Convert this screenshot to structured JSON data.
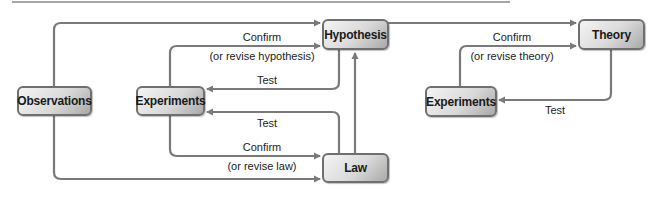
{
  "diagram": {
    "nodes": {
      "observations": "Observations",
      "experiments_left": "Experiments",
      "hypothesis": "Hypothesis",
      "law": "Law",
      "theory": "Theory",
      "experiments_right": "Experiments"
    },
    "edge_labels": {
      "exp_to_hyp_confirm": "Confirm",
      "exp_to_hyp_revise": "(or revise hypothesis)",
      "hyp_to_exp_test": "Test",
      "law_to_exp_test": "Test",
      "exp_to_law_confirm": "Confirm",
      "exp_to_law_revise": "(or revise law)",
      "exp_to_theory_confirm": "Confirm",
      "exp_to_theory_revise": "(or revise theory)",
      "theory_to_exp_test": "Test"
    },
    "colors": {
      "line": "#7a7a7a",
      "box_border": "#6f6f6f",
      "text": "#1a1a1a"
    }
  }
}
